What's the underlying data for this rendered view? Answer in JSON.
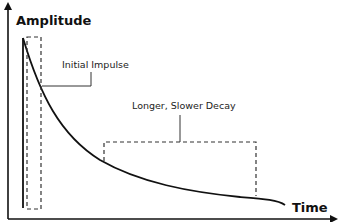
{
  "diagram": {
    "y_axis_label": "Amplitude",
    "x_axis_label": "Time",
    "annotations": [
      {
        "id": "initial-impulse",
        "label": "Initial Impulse"
      },
      {
        "id": "slower-decay",
        "label": "Longer, Slower Decay"
      }
    ],
    "colors": {
      "line": "#111111",
      "dashed": "#333333",
      "background": "#ffffff"
    }
  }
}
